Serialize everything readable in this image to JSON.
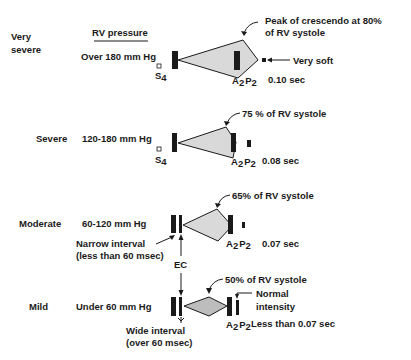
{
  "header": {
    "column_title": "RV pressure"
  },
  "rows": [
    {
      "severity": "Very severe",
      "severity_line1": "Very",
      "severity_line2": "severe",
      "rv_pressure": "Over 180 mm Hg",
      "s4_label": "S",
      "s4_sub": "4",
      "peak_annotation_line1": "Peak of crescendo at 80%",
      "peak_annotation_line2": "of RV systole",
      "p2_annotation": "Very soft",
      "a2_label": "A",
      "a2_sub": "2",
      "p2_label": "P",
      "p2_sub": "2",
      "duration": "0.10 sec"
    },
    {
      "severity": "Severe",
      "rv_pressure": "120-180 mm Hg",
      "s4_label": "S",
      "s4_sub": "4",
      "peak_annotation": "75 % of RV systole",
      "a2_label": "A",
      "a2_sub": "2",
      "p2_label": "P",
      "p2_sub": "2",
      "duration": "0.08 sec"
    },
    {
      "severity": "Moderate",
      "rv_pressure": "60-120 mm Hg",
      "interval_line1": "Narrow interval",
      "interval_line2": "(less than 60 msec)",
      "peak_annotation": "65% of RV systole",
      "a2_label": "A",
      "a2_sub": "2",
      "p2_label": "P",
      "p2_sub": "2",
      "duration": "0.07 sec"
    },
    {
      "severity": "Mild",
      "rv_pressure": "Under 60 mm Hg",
      "interval_line1": "Wide interval",
      "interval_line2": "(over 60 msec)",
      "peak_annotation": "50% of RV systole",
      "p2_annotation_line1": "Normal",
      "p2_annotation_line2": "intensity",
      "a2_label": "A",
      "a2_sub": "2",
      "p2_label": "P",
      "p2_sub": "2",
      "duration": "Less than 0.07 sec"
    }
  ],
  "ejection_click_label": "EC",
  "colors": {
    "ink": "#1a1a1a",
    "murmur_fill": "#d9d9d9",
    "background": "#ffffff"
  }
}
